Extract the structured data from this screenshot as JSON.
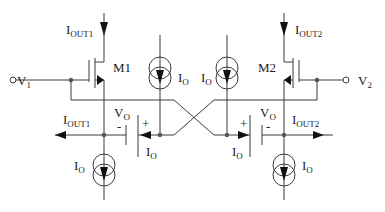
{
  "diagram": {
    "type": "circuit-schematic",
    "colors": {
      "wire": "#3a3a3a",
      "text": "#222222",
      "background": "#ffffff"
    },
    "transistors": [
      {
        "name": "M1",
        "label": "M1"
      },
      {
        "name": "M2",
        "label": "M2"
      }
    ],
    "inputs": [
      {
        "main": "V",
        "sub": "1"
      },
      {
        "main": "V",
        "sub": "2"
      }
    ],
    "output_currents": [
      {
        "main": "I",
        "sub": "OUT1"
      },
      {
        "main": "I",
        "sub": "OUT2"
      }
    ],
    "bottom_output_currents": [
      {
        "main": "I",
        "sub": "OUT1"
      },
      {
        "main": "I",
        "sub": "OUT2"
      }
    ],
    "current_source_label": {
      "main": "I",
      "sub": "O"
    },
    "battery_label": {
      "main": "V",
      "sub": "O"
    },
    "polarity": {
      "plus": "+",
      "minus": "-"
    }
  }
}
